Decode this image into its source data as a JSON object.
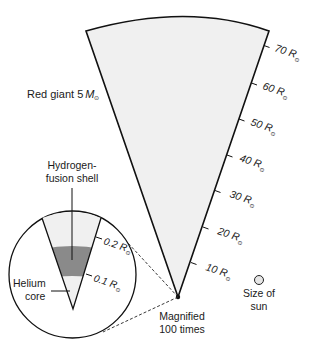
{
  "diagram": {
    "title_label": "Red giant 5",
    "title_mass_symbol": "M",
    "title_mass_subscript": "⊙",
    "radius_scale": {
      "unit_symbol": "R",
      "unit_subscript": "⊙",
      "ticks": [
        {
          "value": "70",
          "label": "70"
        },
        {
          "value": "60",
          "label": "60"
        },
        {
          "value": "50",
          "label": "50"
        },
        {
          "value": "40",
          "label": "40"
        },
        {
          "value": "30",
          "label": "30"
        },
        {
          "value": "20",
          "label": "20"
        },
        {
          "value": "10",
          "label": "10"
        }
      ]
    },
    "sun": {
      "label_line1": "Size of",
      "label_line2": "sun"
    },
    "magnification": {
      "label_line1": "Magnified",
      "label_line2": "100 times"
    },
    "inset": {
      "shell_label_line1": "Hydrogen-",
      "shell_label_line2": "fusion shell",
      "core_label_line1": "Helium",
      "core_label_line2": "core",
      "tick_outer": "0.2",
      "tick_inner": "0.1",
      "unit_symbol": "R",
      "unit_subscript": "⊙"
    },
    "colors": {
      "wedge_fill": "#f0f0f0",
      "shell_fill": "#8a8a8a",
      "outline": "#111111",
      "sun_fill": "#e6e6e6"
    }
  }
}
